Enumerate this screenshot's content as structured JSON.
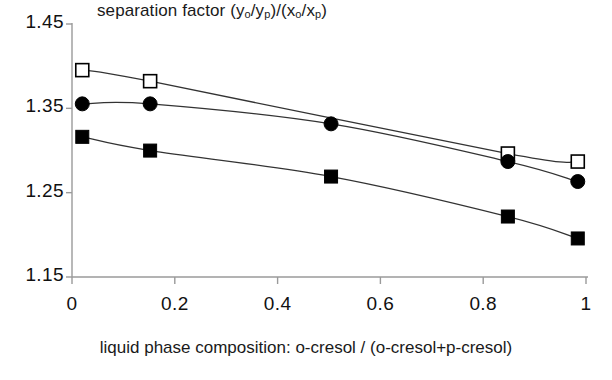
{
  "chart_data": {
    "type": "line",
    "title": "separation factor (yo/yp)/(xo/xp)",
    "title_parts": {
      "prefix": "separation factor (y",
      "sub1": "o",
      "mid1": "/y",
      "sub2": "p",
      "mid2": ")/(x",
      "sub3": "o",
      "mid3": "/x",
      "sub4": "p",
      "suffix": ")"
    },
    "xlabel": "liquid phase composition: o-cresol / (o-cresol+p-cresol)",
    "ylabel": "",
    "xlim": [
      0,
      1
    ],
    "ylim": [
      1.15,
      1.45
    ],
    "xticks": [
      0,
      0.2,
      0.4,
      0.6,
      0.8,
      1
    ],
    "xtick_labels": [
      "0",
      "0.2",
      "0.4",
      "0.6",
      "0.8",
      "1"
    ],
    "yticks": [
      1.15,
      1.25,
      1.35,
      1.45
    ],
    "ytick_labels": [
      "1.15",
      "1.25",
      "1.35",
      "1.45"
    ],
    "grid": false,
    "legend": "none",
    "series": [
      {
        "name": "open-square-series",
        "marker": "open-square",
        "color": "#000000",
        "fill": "#ffffff",
        "points": [
          {
            "x": 0.02,
            "y": 1.3953
          },
          {
            "x": 0.152,
            "y": 1.3822
          },
          {
            "x": 0.848,
            "y": 1.2964
          },
          {
            "x": 0.984,
            "y": 1.2869
          }
        ]
      },
      {
        "name": "filled-circle-series",
        "marker": "filled-circle",
        "color": "#000000",
        "fill": "#000000",
        "points": [
          {
            "x": 0.02,
            "y": 1.3553
          },
          {
            "x": 0.152,
            "y": 1.3553
          },
          {
            "x": 0.504,
            "y": 1.3316
          },
          {
            "x": 0.848,
            "y": 1.2869
          },
          {
            "x": 0.984,
            "y": 1.2632
          }
        ]
      },
      {
        "name": "filled-square-series",
        "marker": "filled-square",
        "color": "#000000",
        "fill": "#000000",
        "points": [
          {
            "x": 0.02,
            "y": 1.3162
          },
          {
            "x": 0.152,
            "y": 1.2999
          },
          {
            "x": 0.504,
            "y": 1.2691
          },
          {
            "x": 0.848,
            "y": 1.2217
          },
          {
            "x": 0.984,
            "y": 1.1957
          }
        ]
      }
    ]
  },
  "axes": {
    "y_title_text": "separation factor"
  }
}
